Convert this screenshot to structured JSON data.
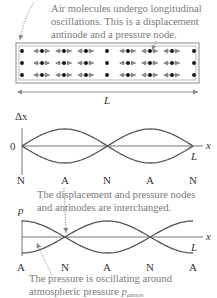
{
  "colors": {
    "caption": "#7a7a7a",
    "curve": "#555555",
    "axis": "#666666",
    "tube": "#888888",
    "molecule": "#111111",
    "arrow": "#999999",
    "leader": "#888888"
  },
  "tube": {
    "caption_lines": [
      "Air molecules undergo longitudinal",
      "oscillations. This is a displacement",
      "antinode and a pressure node."
    ],
    "length_label": "L",
    "rows": 3,
    "columns": [
      {
        "type": "fixed"
      },
      {
        "type": "oscillating"
      },
      {
        "type": "oscillating"
      },
      {
        "type": "oscillating"
      },
      {
        "type": "fixed"
      },
      {
        "type": "oscillating"
      },
      {
        "type": "oscillating"
      },
      {
        "type": "oscillating"
      },
      {
        "type": "fixed"
      }
    ]
  },
  "displacement_graph": {
    "y_axis_label": "Δx",
    "x_axis_label": "x",
    "origin_label": "0",
    "end_label": "L",
    "node_labels": [
      "N",
      "A",
      "N",
      "A",
      "N"
    ],
    "half_wavelengths": 2,
    "ends": "node"
  },
  "middle_caption": [
    "The displacement and pressure nodes",
    "and antinodes are interchanged."
  ],
  "pressure_graph": {
    "y_axis_label": "p",
    "x_axis_label": "x",
    "end_label": "L",
    "node_labels": [
      "A",
      "N",
      "A",
      "N",
      "A"
    ],
    "half_wavelengths": 2,
    "ends": "antinode"
  },
  "bottom_caption": {
    "line1": "The pressure is oscillating around",
    "line2_prefix": "atmospheric pressure ",
    "symbol": "p",
    "subscript": "atmos"
  }
}
